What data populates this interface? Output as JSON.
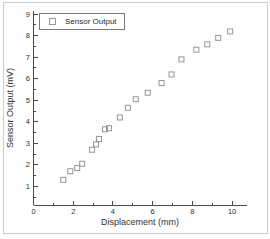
{
  "figure": {
    "background": "#fefefe",
    "frame_color": "#cbcbcb"
  },
  "chart_data": {
    "type": "scatter",
    "title": "",
    "xlabel": "Displacement (mm)",
    "ylabel": "Sensor Output (mV)",
    "xlim": [
      0,
      10.75
    ],
    "ylim": [
      0.13,
      9.15
    ],
    "x_ticks": [
      0,
      2,
      4,
      6,
      8,
      10
    ],
    "y_ticks": [
      1,
      2,
      3,
      4,
      5,
      6,
      7,
      8,
      9
    ],
    "x_minor_step": 1,
    "y_minor_step": 0.5,
    "grid": false,
    "axis_color": "#4a4a4a",
    "tick_label_color": "#2f2f2f",
    "legend": {
      "position": "top-left",
      "border_color": "#7a7a7a",
      "background": "#ffffff"
    },
    "series": [
      {
        "name": "Sensor Output",
        "marker": "open-square",
        "marker_color": "#969696",
        "points": [
          [
            1.5,
            1.3
          ],
          [
            1.85,
            1.7
          ],
          [
            2.2,
            1.85
          ],
          [
            2.45,
            2.05
          ],
          [
            2.95,
            2.7
          ],
          [
            3.15,
            2.95
          ],
          [
            3.3,
            3.2
          ],
          [
            3.6,
            3.65
          ],
          [
            3.8,
            3.7
          ],
          [
            4.35,
            4.2
          ],
          [
            4.75,
            4.65
          ],
          [
            5.15,
            5.05
          ],
          [
            5.75,
            5.35
          ],
          [
            6.45,
            5.8
          ],
          [
            6.95,
            6.2
          ],
          [
            7.45,
            6.9
          ],
          [
            8.2,
            7.35
          ],
          [
            8.75,
            7.6
          ],
          [
            9.3,
            7.9
          ],
          [
            9.9,
            8.2
          ]
        ]
      }
    ]
  }
}
